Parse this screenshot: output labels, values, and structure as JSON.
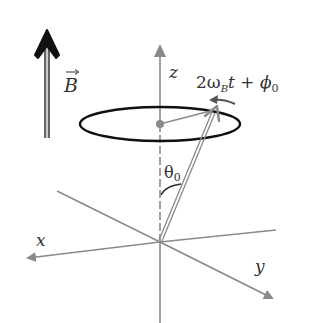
{
  "diagram": {
    "type": "spin-precession",
    "labels": {
      "field": "B",
      "z_axis": "z",
      "x_axis": "x",
      "y_axis": "y",
      "phase": "2ω",
      "phase_sub": "B",
      "phase_rest": "t + ϕ",
      "phase_rest_sub": "0",
      "angle": "θ",
      "angle_sub": "0"
    },
    "colors": {
      "axis": "#8a8a8a",
      "ellipse": "#111111",
      "field_arrow": "#111111",
      "vector": "#8a8a8a",
      "text": "#333333",
      "rotation_arrow": "#555555"
    }
  }
}
